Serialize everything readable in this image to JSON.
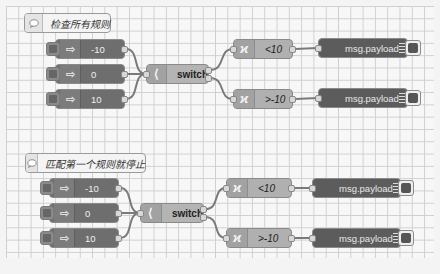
{
  "colors": {
    "canvas_bg": "#f7f7f7",
    "grid_line": "#cfcfcf",
    "inject_fill": "#6e6e6e",
    "switch_fill": "#b4b4b4",
    "function_fill": "#b0b0b0",
    "debug_fill": "#5c5c5c",
    "wire": "#7a7a7a"
  },
  "flows": [
    {
      "comment": {
        "icon": "comment-icon",
        "label": "检查所有规则"
      },
      "injects": [
        {
          "icon": "inject-arrow-icon",
          "label": "-10"
        },
        {
          "icon": "inject-arrow-icon",
          "label": "0"
        },
        {
          "icon": "inject-arrow-icon",
          "label": "10"
        }
      ],
      "switch": {
        "icon": "switch-icon",
        "label": "switch"
      },
      "functions": [
        {
          "icon": "function-icon",
          "label": "<10"
        },
        {
          "icon": "function-icon",
          "label": ">-10"
        }
      ],
      "debugs": [
        {
          "icon": "debug-list-icon",
          "label": "msg.payload"
        },
        {
          "icon": "debug-list-icon",
          "label": "msg.payload"
        }
      ]
    },
    {
      "comment": {
        "icon": "comment-icon",
        "label": "匹配第一个规则就停止"
      },
      "injects": [
        {
          "icon": "inject-arrow-icon",
          "label": "-10"
        },
        {
          "icon": "inject-arrow-icon",
          "label": "0"
        },
        {
          "icon": "inject-arrow-icon",
          "label": "10"
        }
      ],
      "switch": {
        "icon": "switch-icon",
        "label": "switch"
      },
      "functions": [
        {
          "icon": "function-icon",
          "label": "<10"
        },
        {
          "icon": "function-icon",
          "label": ">-10"
        }
      ],
      "debugs": [
        {
          "icon": "debug-list-icon",
          "label": "msg.payload"
        },
        {
          "icon": "debug-list-icon",
          "label": "msg.payload"
        }
      ]
    }
  ]
}
